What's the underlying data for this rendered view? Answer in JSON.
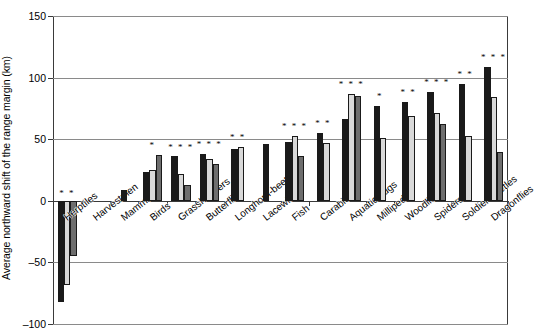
{
  "chart_data": {
    "type": "bar",
    "title": "",
    "subtitle": "",
    "xlabel": "",
    "ylabel": "Average northward shift of the range margin (km)",
    "ylim": [
      -100,
      150
    ],
    "yticks": [
      150,
      100,
      50,
      0,
      -50,
      -100
    ],
    "ytick_labels": [
      "150",
      "100",
      "50",
      "0",
      "–50",
      "–100"
    ],
    "grid": true,
    "grid_axis": "y",
    "legend_position": "none",
    "categories": [
      "Herptiles",
      "Harvestmen",
      "Mammals",
      "Birds",
      "Grasshoppers",
      "Butterflies",
      "Longhorn-beetles",
      "Lacewings",
      "Fish",
      "Carabids",
      "Aquatic bugs",
      "Millipedes",
      "Woodlice",
      "Spiders",
      "Soldier-beetles",
      "Dragonflies"
    ],
    "series": [
      {
        "name": "series-1",
        "color": "#1a1a1a",
        "values": [
          -82,
          null,
          9,
          23,
          36,
          38,
          42,
          46,
          48,
          55,
          66,
          77,
          80,
          88,
          95,
          109
        ]
      },
      {
        "name": "series-2",
        "color": "#d9d9d9",
        "values": [
          -68,
          null,
          null,
          25,
          22,
          34,
          44,
          null,
          53,
          47,
          87,
          51,
          69,
          71,
          53,
          84
        ]
      },
      {
        "name": "series-3",
        "color": "#6e6e6e",
        "values": [
          -45,
          null,
          null,
          37,
          13,
          30,
          null,
          null,
          36,
          null,
          85,
          null,
          null,
          62,
          null,
          40
        ]
      }
    ],
    "significance": [
      {
        "category": "Herptiles",
        "marks": "* *",
        "y": 2
      },
      {
        "category": "Birds",
        "marks": "*",
        "y": 41
      },
      {
        "category": "Grasshoppers",
        "marks": "* * *",
        "y": 40
      },
      {
        "category": "Butterflies",
        "marks": "* * *",
        "y": 42
      },
      {
        "category": "Longhorn-beetles",
        "marks": "* *",
        "y": 48
      },
      {
        "category": "Fish",
        "marks": "* * *",
        "y": 57
      },
      {
        "category": "Carabids",
        "marks": "* *",
        "y": 59
      },
      {
        "category": "Aquatic bugs",
        "marks": "* * *",
        "y": 91
      },
      {
        "category": "Millipedes",
        "marks": "*",
        "y": 81
      },
      {
        "category": "Woodlice",
        "marks": "* *",
        "y": 84
      },
      {
        "category": "Spiders",
        "marks": "* * *",
        "y": 92
      },
      {
        "category": "Soldier-beetles",
        "marks": "* *",
        "y": 99
      },
      {
        "category": "Dragonflies",
        "marks": "* * *",
        "y": 113
      }
    ]
  }
}
